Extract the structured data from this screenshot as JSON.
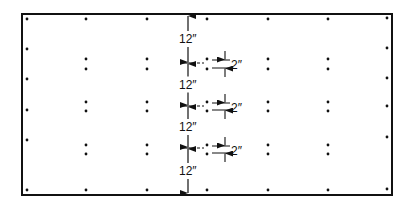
{
  "diagram": {
    "panel": {
      "x": 22,
      "y": 14,
      "width": 370,
      "height": 181,
      "stroke": "#111111"
    },
    "dimension_labels": {
      "spacing_12": [
        "12″",
        "12″",
        "12″",
        "12″"
      ],
      "spacing_2": [
        "2″",
        "2″",
        "2″"
      ]
    },
    "edge_dots": {
      "top": [
        [
          27,
          19
        ],
        [
          86,
          19
        ],
        [
          147,
          19
        ],
        [
          207,
          19
        ],
        [
          268,
          19
        ],
        [
          328,
          19
        ],
        [
          387,
          18
        ]
      ],
      "bottom": [
        [
          27,
          190
        ],
        [
          86,
          190
        ],
        [
          147,
          190
        ],
        [
          207,
          190
        ],
        [
          268,
          190
        ],
        [
          328,
          190
        ],
        [
          387,
          189
        ]
      ],
      "left": [
        [
          27,
          49
        ],
        [
          27,
          79
        ],
        [
          27,
          110
        ],
        [
          27,
          140
        ]
      ],
      "right": [
        [
          387,
          48
        ],
        [
          387,
          78
        ],
        [
          387,
          106
        ],
        [
          387,
          137
        ]
      ]
    },
    "interior_pairs": {
      "rows": [
        [
          59,
          69
        ],
        [
          102,
          111
        ],
        [
          145,
          154
        ]
      ],
      "columns": [
        86,
        147,
        268,
        328
      ],
      "near_dim_column": 207
    },
    "dimension_line": {
      "x": 188,
      "top": 14,
      "bottom": 195
    },
    "cross_lines_y": [
      63,
      106,
      148
    ]
  }
}
